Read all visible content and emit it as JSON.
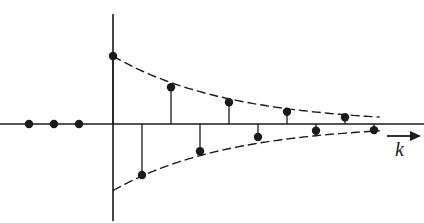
{
  "chart_data": {
    "type": "stem",
    "title": "",
    "xlabel": "k",
    "ylabel": "",
    "x": [
      -3,
      -2,
      -1,
      0,
      1,
      2,
      3,
      4,
      5,
      6,
      7,
      8,
      9
    ],
    "values": [
      0,
      0,
      0,
      1.0,
      -0.75,
      0.54,
      -0.4,
      0.32,
      -0.19,
      0.18,
      -0.1,
      0.1,
      -0.09
    ],
    "envelope": {
      "upper": "dashed decaying curve through positive samples",
      "lower": "dashed decaying curve through negative samples"
    },
    "grid": false,
    "axis_arrow": "right-pointing arrow below axis labeled k"
  },
  "labels": {
    "axis": "k"
  },
  "colors": {
    "ink": "#1a1a1a",
    "background": "#ffffff"
  }
}
